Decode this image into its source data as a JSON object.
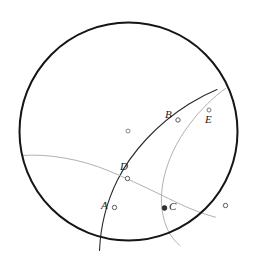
{
  "figure": {
    "type": "hyperbolic-disk-diagram",
    "background": "#ffffff",
    "width": 258,
    "height": 265,
    "boundary_circle": {
      "name": "boundary-circle",
      "cx": 128.5,
      "cy": 131.5,
      "r": 109,
      "stroke": "#151515",
      "stroke_width": 2.0,
      "fill": "none"
    },
    "center_marker": {
      "name": "disk-center",
      "cx": 128.0,
      "cy": 131.0,
      "r": 2.0,
      "stroke": "#6b6b6b",
      "fill": "#ffffff"
    },
    "curves": [
      {
        "name": "geodesic-dark-ADB",
        "d": "M 99.5 250.5 C 100.5 228 106.0 203.0 117.5 180.0 C 131.5 152.0 157.0 124.0 189.0 104.0 C 200.0 97.2 209.5 92.6 217.0 89.5",
        "stroke": "#2a2a2a",
        "stroke_width": 1.1,
        "fill": "none"
      },
      {
        "name": "geodesic-light-left-D-C",
        "d": "M 21.5 155.5 C 48.0 153.5 80.0 159.0 108.0 170.5 C 136.0 182.0 163.5 196.5 186.5 207.0 C 197.0 211.6 207.0 215.0 215.5 217.2",
        "stroke": "#a8a8a8",
        "stroke_width": 0.9,
        "fill": "none"
      },
      {
        "name": "geodesic-light-E-C-bottom",
        "d": "M 225.5 88.5 C 214.0 96.5 201.0 109.0 189.0 125.0 C 176.5 141.5 168.0 160.0 164.0 177.5 C 160.0 195.0 160.5 212.0 166.5 227.0 C 170.0 235.5 175.0 241.5 180.0 245.5",
        "stroke": "#a8a8a8",
        "stroke_width": 0.9,
        "fill": "none"
      }
    ],
    "points": [
      {
        "id": "A",
        "name": "point-a",
        "label": "A",
        "cx": 114.5,
        "cy": 207.5,
        "r": 2.2,
        "style": "open",
        "stroke": "#4a4a4a",
        "fill": "#ffffff",
        "label_x": 101.0,
        "label_y": 200.0
      },
      {
        "id": "B",
        "name": "point-b",
        "label": "B",
        "cx": 178.0,
        "cy": 120.0,
        "r": 2.2,
        "style": "open",
        "stroke": "#4a4a4a",
        "fill": "#ffffff",
        "label_x": 165.0,
        "label_y": 109.0
      },
      {
        "id": "C",
        "name": "point-c",
        "label": "C",
        "cx": 164.5,
        "cy": 208.0,
        "r": 2.4,
        "style": "filled",
        "stroke": "#303030",
        "fill": "#303030",
        "label_x": 169.0,
        "label_y": 201.0
      },
      {
        "id": "D",
        "name": "point-d",
        "label": "D",
        "cx": 127.5,
        "cy": 178.5,
        "r": 2.2,
        "style": "open",
        "stroke": "#4a4a4a",
        "fill": "#ffffff",
        "label_x": 120.0,
        "label_y": 161.0
      },
      {
        "id": "E",
        "name": "point-e",
        "label": "E",
        "cx": 209.0,
        "cy": 110.0,
        "r": 2.0,
        "style": "open",
        "stroke": "#6b6b6b",
        "fill": "#ffffff",
        "label_x": 205.0,
        "label_y": 114.0
      },
      {
        "id": "P",
        "name": "point-boundary-right",
        "label": "",
        "cx": 225.5,
        "cy": 205.5,
        "r": 2.2,
        "style": "open",
        "stroke": "#4a4a4a",
        "fill": "#ffffff",
        "label_x": 0,
        "label_y": 0
      }
    ]
  }
}
